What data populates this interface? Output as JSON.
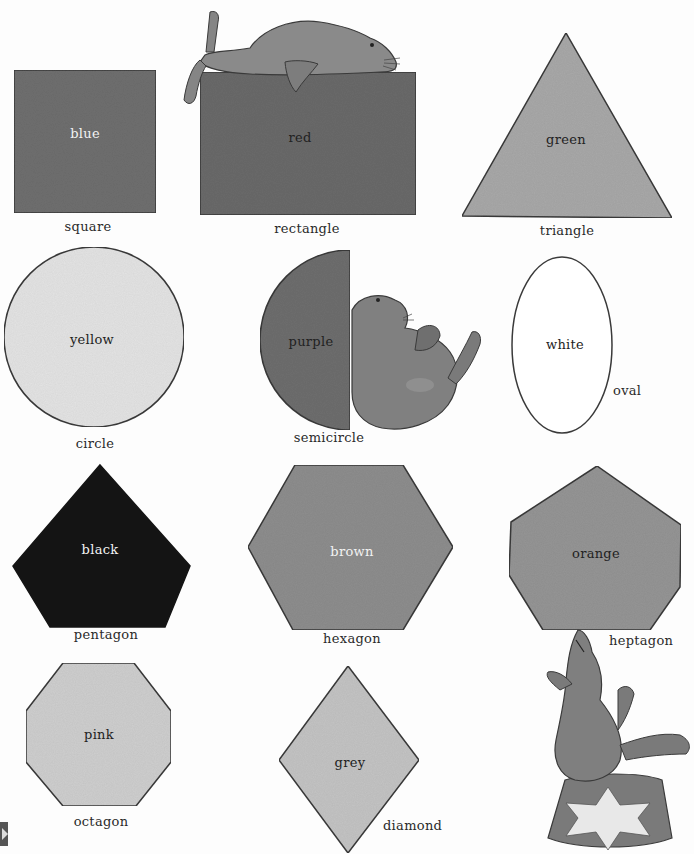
{
  "shapes": [
    {
      "id": "square",
      "shape_name": "square",
      "color_name": "blue",
      "fill": "#707070",
      "text_tone": "light"
    },
    {
      "id": "rectangle",
      "shape_name": "rectangle",
      "color_name": "red",
      "fill": "#6a6a6a",
      "text_tone": "dark"
    },
    {
      "id": "triangle",
      "shape_name": "triangle",
      "color_name": "green",
      "fill": "#a9a9a9",
      "text_tone": "dark"
    },
    {
      "id": "circle",
      "shape_name": "circle",
      "color_name": "yellow",
      "fill": "#e4e4e4",
      "text_tone": "dark"
    },
    {
      "id": "semicircle",
      "shape_name": "semicircle",
      "color_name": "purple",
      "fill": "#6e6e6e",
      "text_tone": "dark"
    },
    {
      "id": "oval",
      "shape_name": "oval",
      "color_name": "white",
      "fill": "#ffffff",
      "text_tone": "dark"
    },
    {
      "id": "pentagon",
      "shape_name": "pentagon",
      "color_name": "black",
      "fill": "#141414",
      "text_tone": "light"
    },
    {
      "id": "hexagon",
      "shape_name": "hexagon",
      "color_name": "brown",
      "fill": "#8e8e8e",
      "text_tone": "light"
    },
    {
      "id": "heptagon",
      "shape_name": "heptagon",
      "color_name": "orange",
      "fill": "#959595",
      "text_tone": "dark"
    },
    {
      "id": "octagon",
      "shape_name": "octagon",
      "color_name": "pink",
      "fill": "#cfcfcf",
      "text_tone": "dark"
    },
    {
      "id": "diamond",
      "shape_name": "diamond",
      "color_name": "grey",
      "fill": "#c4c4c4",
      "text_tone": "dark"
    }
  ],
  "illustrations": [
    {
      "id": "seal-lying-on-rectangle",
      "icon": "seal-icon"
    },
    {
      "id": "seal-sitting-by-semicircle",
      "icon": "seal-icon"
    },
    {
      "id": "seal-balancing-heptagon-on-drum",
      "icon": "seal-icon"
    },
    {
      "id": "circus-drum-with-star",
      "icon": "star-icon"
    }
  ]
}
